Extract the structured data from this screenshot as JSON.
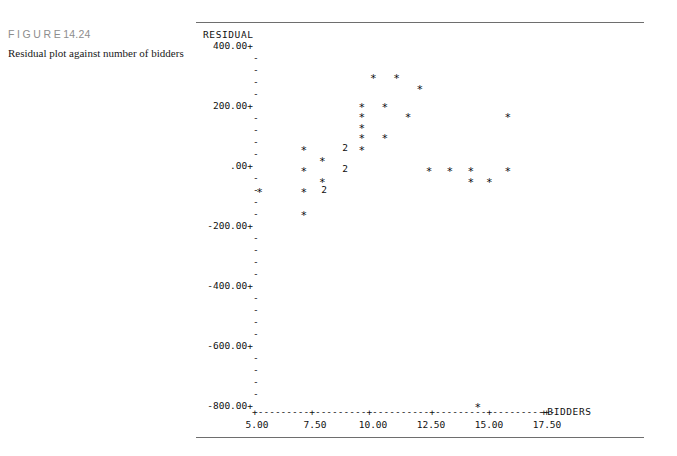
{
  "figure": {
    "tag_word": "FIGURE",
    "tag_number": "14.24",
    "caption": "Residual plot against number of bidders"
  },
  "chart_data": {
    "type": "scatter",
    "title": "Residual plot against number of bidders",
    "xlabel": "BIDDERS",
    "ylabel": "RESIDUAL",
    "xlim": [
      4.0,
      18.6
    ],
    "ylim": [
      -860,
      430
    ],
    "grid": false,
    "legend": null,
    "style": "character-plot",
    "y_tick_labels": [
      "400.00+",
      "-",
      "-",
      "-",
      "-",
      "200.00+",
      "-",
      "-",
      "-",
      "-",
      ".00+",
      "-",
      "-",
      "-",
      "-",
      "-200.00+",
      "-",
      "-",
      "-",
      "-",
      "-400.00+",
      "-",
      "-",
      "-",
      "-",
      "-600.00+",
      "-",
      "-",
      "-",
      "-",
      "-800.00+"
    ],
    "y_major_labels": [
      "400.00+",
      "200.00+",
      ".00+",
      "-200.00+",
      "-400.00+",
      "-600.00+",
      "-800.00+"
    ],
    "y_major_values": [
      400,
      200,
      0,
      -200,
      -400,
      -600,
      -800
    ],
    "x_tick_labels": [
      "5.00",
      "7.50",
      "10.00",
      "12.50",
      "15.00",
      "17.50"
    ],
    "x_tick_values": [
      5.0,
      7.5,
      10.0,
      12.5,
      15.0,
      17.5
    ],
    "marker_single": "*",
    "marker_double": "2",
    "points": [
      {
        "x": 10.0,
        "y": 300,
        "marker": "*",
        "count": 1
      },
      {
        "x": 11.0,
        "y": 300,
        "marker": "*",
        "count": 1
      },
      {
        "x": 12.0,
        "y": 265,
        "marker": "*",
        "count": 1
      },
      {
        "x": 9.5,
        "y": 205,
        "marker": "*",
        "count": 1
      },
      {
        "x": 10.5,
        "y": 205,
        "marker": "*",
        "count": 1
      },
      {
        "x": 9.5,
        "y": 170,
        "marker": "*",
        "count": 1
      },
      {
        "x": 11.5,
        "y": 170,
        "marker": "*",
        "count": 1
      },
      {
        "x": 15.8,
        "y": 170,
        "marker": "*",
        "count": 1
      },
      {
        "x": 9.5,
        "y": 135,
        "marker": "*",
        "count": 1
      },
      {
        "x": 9.5,
        "y": 100,
        "marker": "*",
        "count": 1
      },
      {
        "x": 10.5,
        "y": 100,
        "marker": "*",
        "count": 1
      },
      {
        "x": 7.0,
        "y": 60,
        "marker": "*",
        "count": 1
      },
      {
        "x": 8.8,
        "y": 60,
        "marker": "2",
        "count": 2
      },
      {
        "x": 9.5,
        "y": 60,
        "marker": "*",
        "count": 1
      },
      {
        "x": 7.8,
        "y": 25,
        "marker": "*",
        "count": 1
      },
      {
        "x": 7.0,
        "y": -10,
        "marker": "*",
        "count": 1
      },
      {
        "x": 8.8,
        "y": -10,
        "marker": "2",
        "count": 2
      },
      {
        "x": 12.4,
        "y": -10,
        "marker": "*",
        "count": 1
      },
      {
        "x": 13.3,
        "y": -10,
        "marker": "*",
        "count": 1
      },
      {
        "x": 14.2,
        "y": -10,
        "marker": "*",
        "count": 1
      },
      {
        "x": 15.8,
        "y": -10,
        "marker": "*",
        "count": 1
      },
      {
        "x": 7.8,
        "y": -45,
        "marker": "*",
        "count": 1
      },
      {
        "x": 14.2,
        "y": -45,
        "marker": "*",
        "count": 1
      },
      {
        "x": 15.0,
        "y": -45,
        "marker": "*",
        "count": 1
      },
      {
        "x": 5.1,
        "y": -80,
        "marker": "*",
        "count": 1
      },
      {
        "x": 7.0,
        "y": -80,
        "marker": "*",
        "count": 1
      },
      {
        "x": 7.9,
        "y": -80,
        "marker": "2",
        "count": 2
      },
      {
        "x": 7.0,
        "y": -155,
        "marker": "*",
        "count": 1
      },
      {
        "x": 14.5,
        "y": -795,
        "marker": "*",
        "count": 1
      }
    ]
  }
}
